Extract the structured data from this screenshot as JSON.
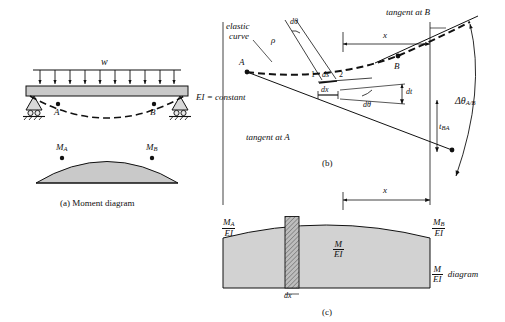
{
  "figure": {
    "caption_a": "(a) Moment diagram",
    "caption_b": "(b)",
    "caption_c": "(c)"
  },
  "panel_a": {
    "load_label": "w",
    "ei_label": "EI = constant",
    "point_a": "A",
    "point_b": "B",
    "moment_a_M": "M",
    "moment_a_sub": "A",
    "moment_b_M": "M",
    "moment_b_sub": "B"
  },
  "panel_b": {
    "elastic_curve_line1": "elastic",
    "elastic_curve_line2": "curve",
    "tangent_at_b": "tangent at B",
    "tangent_at_a": "tangent at A",
    "point_a": "A",
    "point_b": "B",
    "d_theta_top": "dθ",
    "rho": "ρ",
    "x": "x",
    "ds_upper": "ds",
    "dx": "dx",
    "dt": "dt",
    "d_theta_lower": "dθ",
    "num_1": "1",
    "num_2": "2",
    "delta_theta_AB": "Δθ",
    "delta_theta_AB_sub": "A/B",
    "t_BA": "t",
    "t_BA_sub": "BA"
  },
  "panel_c": {
    "x_label": "x",
    "left_M": "M",
    "left_sub": "A",
    "left_den": "EI",
    "right_M": "M",
    "right_sub": "B",
    "right_den": "EI",
    "center_num": "M",
    "center_den": "EI",
    "diagram_num": "M",
    "diagram_den": "EI",
    "diagram_word": "diagram",
    "dx_label": "dx"
  },
  "colors": {
    "stroke": "#111111",
    "beam_fill": "#c9c9c9",
    "diagram_fill": "#d2d2d2",
    "hatch_fill": "#a8a8a8",
    "white": "#ffffff"
  }
}
